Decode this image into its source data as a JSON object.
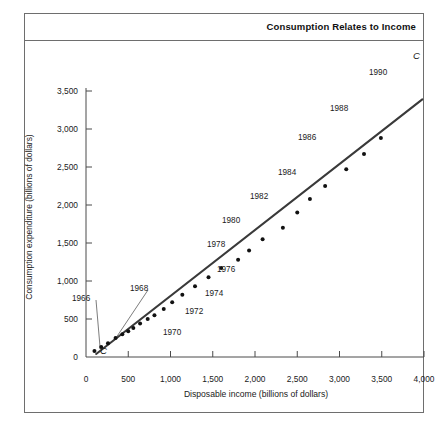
{
  "figure": {
    "title": "Consumption Relates to Income",
    "curve_label": "C",
    "curve_label_origin": "C"
  },
  "axes": {
    "y_title": "Consumption expenditure (billions of dollars)",
    "x_title": "Disposable income (billions of dollars)",
    "y_ticks": [
      "0",
      "500",
      "1,000",
      "1,500",
      "2,000",
      "2,500",
      "3,000",
      "3,500"
    ],
    "x_ticks": [
      "0",
      "500",
      "1,000",
      "1,500",
      "2,000",
      "2,500",
      "3,000",
      "3,500",
      "4,000"
    ]
  },
  "chart_data": {
    "type": "scatter",
    "title": "Consumption Relates to Income",
    "xlabel": "Disposable income (billions of dollars)",
    "ylabel": "Consumption expenditure (billions of dollars)",
    "xlim": [
      0,
      4000
    ],
    "ylim": [
      0,
      3500
    ],
    "x_ticks": [
      0,
      500,
      1000,
      1500,
      2000,
      2500,
      3000,
      3500,
      4000
    ],
    "y_ticks": [
      0,
      500,
      1000,
      1500,
      2000,
      2500,
      3000,
      3500
    ],
    "grid": false,
    "legend": "none",
    "annotations": [
      {
        "text": "C",
        "x": 4050,
        "y": 3420,
        "style": "italic",
        "note": "consumption function line label, upper right"
      },
      {
        "text": "C",
        "x": 190,
        "y": 60,
        "style": "italic",
        "note": "consumption function line label, near origin"
      }
    ],
    "series": [
      {
        "name": "Consumption expenditure vs disposable income, 1965-1990",
        "marker": "filled-circle",
        "points": [
          {
            "year": 1965,
            "x": 100,
            "y": 80,
            "label": ""
          },
          {
            "year": 1966,
            "x": 180,
            "y": 130,
            "label": "1966",
            "label_leader": true
          },
          {
            "year": 1967,
            "x": 260,
            "y": 180,
            "label": ""
          },
          {
            "year": 1968,
            "x": 350,
            "y": 250,
            "label": "1968",
            "label_leader": true
          },
          {
            "year": 1969,
            "x": 430,
            "y": 300,
            "label": ""
          },
          {
            "year": 1970,
            "x": 500,
            "y": 340,
            "label": "1970"
          },
          {
            "year": 1971,
            "x": 560,
            "y": 380,
            "label": ""
          },
          {
            "year": 1972,
            "x": 640,
            "y": 440,
            "label": "1972"
          },
          {
            "year": 1973,
            "x": 730,
            "y": 500,
            "label": ""
          },
          {
            "year": 1974,
            "x": 810,
            "y": 550,
            "label": "1974"
          },
          {
            "year": 1975,
            "x": 920,
            "y": 630,
            "label": ""
          },
          {
            "year": 1976,
            "x": 1020,
            "y": 720,
            "label": "1976"
          },
          {
            "year": 1977,
            "x": 1140,
            "y": 820,
            "label": ""
          },
          {
            "year": 1978,
            "x": 1290,
            "y": 930,
            "label": "1978"
          },
          {
            "year": 1979,
            "x": 1450,
            "y": 1050,
            "label": ""
          },
          {
            "year": 1980,
            "x": 1600,
            "y": 1170,
            "label": "1980"
          },
          {
            "year": 1981,
            "x": 1800,
            "y": 1280,
            "label": ""
          },
          {
            "year": 1982,
            "x": 1930,
            "y": 1400,
            "label": "1982"
          },
          {
            "year": 1983,
            "x": 2090,
            "y": 1550,
            "label": ""
          },
          {
            "year": 1984,
            "x": 2330,
            "y": 1700,
            "label": "1984"
          },
          {
            "year": 1985,
            "x": 2500,
            "y": 1900,
            "label": ""
          },
          {
            "year": 1986,
            "x": 2650,
            "y": 2080,
            "label": "1986"
          },
          {
            "year": 1987,
            "x": 2830,
            "y": 2250,
            "label": ""
          },
          {
            "year": 1988,
            "x": 3080,
            "y": 2470,
            "label": "1988"
          },
          {
            "year": 1989,
            "x": 3290,
            "y": 2670,
            "label": ""
          },
          {
            "year": 1990,
            "x": 3490,
            "y": 2880,
            "label": "1990"
          }
        ]
      }
    ],
    "fit_line": {
      "name": "C",
      "from": {
        "x": 120,
        "y": 40
      },
      "to": {
        "x": 3980,
        "y": 3390
      },
      "style": "solid"
    }
  }
}
